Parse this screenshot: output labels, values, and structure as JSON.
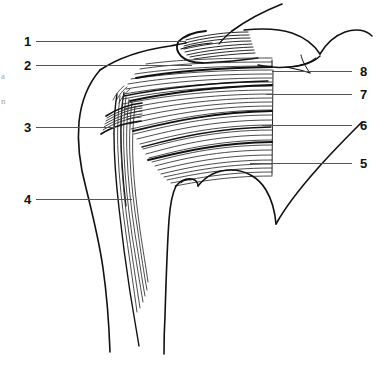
{
  "figure": {
    "background_color": "#ffffff",
    "ink_color": "#111111",
    "leader_color": "#555555",
    "width": 389,
    "height": 388
  },
  "labels": [
    {
      "id": "1",
      "text": "1",
      "side": "left",
      "x": 24,
      "y": 35,
      "leader_from_x": 36,
      "leader_to_x": 186,
      "leader_y": 41
    },
    {
      "id": "2",
      "text": "2",
      "side": "left",
      "x": 24,
      "y": 59,
      "leader_from_x": 36,
      "leader_to_x": 192,
      "leader_y": 65
    },
    {
      "id": "3",
      "text": "3",
      "side": "left",
      "x": 24,
      "y": 121,
      "leader_from_x": 36,
      "leader_to_x": 115,
      "leader_y": 127
    },
    {
      "id": "4",
      "text": "4",
      "side": "left",
      "x": 24,
      "y": 193,
      "leader_from_x": 36,
      "leader_to_x": 132,
      "leader_y": 199
    },
    {
      "id": "5",
      "text": "5",
      "side": "right",
      "x": 360,
      "y": 157,
      "leader_from_x": 250,
      "leader_to_x": 352,
      "leader_y": 163
    },
    {
      "id": "6",
      "text": "6",
      "side": "right",
      "x": 360,
      "y": 119,
      "leader_from_x": 262,
      "leader_to_x": 352,
      "leader_y": 125
    },
    {
      "id": "7",
      "text": "7",
      "side": "right",
      "x": 360,
      "y": 88,
      "leader_from_x": 266,
      "leader_to_x": 352,
      "leader_y": 94
    },
    {
      "id": "8",
      "text": "8",
      "side": "right",
      "x": 360,
      "y": 65,
      "leader_from_x": 272,
      "leader_to_x": 352,
      "leader_y": 71
    }
  ],
  "margin_fragments": [
    {
      "text": "a",
      "x": 1,
      "y": 72
    },
    {
      "text": "n",
      "x": 1,
      "y": 97
    }
  ]
}
